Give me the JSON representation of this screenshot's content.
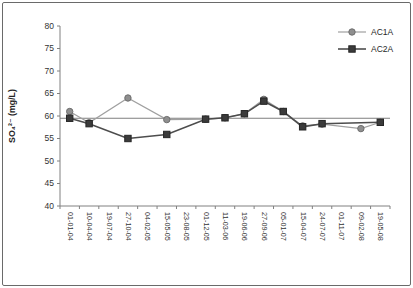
{
  "figure": {
    "background": "#ffffff",
    "border_color": "#6a6a6a"
  },
  "chart_data": {
    "type": "line",
    "title": "",
    "xlabel": "",
    "ylabel": "SO₄²⁻ (mg/L)",
    "ylim": [
      40,
      80
    ],
    "yticks": [
      40,
      45,
      50,
      55,
      60,
      65,
      70,
      75,
      80
    ],
    "grid": false,
    "legend_position": "top-right",
    "reference_line": {
      "value": 59.5,
      "color": "#7f7f7f"
    },
    "axis_color": "#808080",
    "tick_label_color": "#333333",
    "categories": [
      "01-01-04",
      "10-04-04",
      "19-07-04",
      "27-10-04",
      "04-02-05",
      "15-05-05",
      "23-08-05",
      "01-12-05",
      "11-03-06",
      "19-06-06",
      "27-09-06",
      "05-01-07",
      "15-04-07",
      "24-07-07",
      "01-11-07",
      "09-02-08",
      "19-05-08"
    ],
    "series": [
      {
        "name": "AC1A",
        "marker": "circle",
        "line_color": "#a0a0a0",
        "marker_fill": "#8f8f8f",
        "marker_stroke": "#6e6e6e",
        "values": [
          61.0,
          58.5,
          null,
          64.0,
          null,
          59.2,
          null,
          59.3,
          59.6,
          60.5,
          63.7,
          61.0,
          57.8,
          58.2,
          null,
          57.2,
          58.6
        ]
      },
      {
        "name": "AC2A",
        "marker": "square",
        "line_color": "#4d4d4d",
        "marker_fill": "#3b3b3b",
        "marker_stroke": "#262626",
        "values": [
          59.5,
          58.3,
          null,
          55.0,
          null,
          55.9,
          null,
          59.3,
          59.6,
          60.5,
          63.3,
          61.0,
          57.6,
          58.3,
          null,
          null,
          58.6
        ]
      }
    ]
  }
}
